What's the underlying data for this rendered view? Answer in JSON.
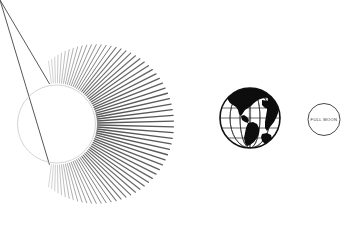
{
  "scene": {
    "title": "Sun, Earth and Full Moon diagram",
    "background_color": "#ffffff",
    "width": 354,
    "height": 241
  },
  "sun": {
    "name": "Sun",
    "center_x": 56.5,
    "center_y": 124,
    "radius": 39,
    "outline_color": "#c9c9c9",
    "outline_width": 0.8,
    "rays": {
      "count": 72,
      "color": "#585858",
      "start_angle_deg": -100,
      "end_angle_deg": 100,
      "inner_radius": 41,
      "min_length": 22,
      "max_length": 76,
      "max_width": 1.35,
      "min_width": 0.45
    }
  },
  "earth": {
    "name": "Earth",
    "center_x": 250,
    "center_y": 118,
    "radius": 30,
    "ocean_color": "#ffffff",
    "land_color": "#0d0d0d",
    "grid_color": "#2b2b2b",
    "outline_color": "#111111",
    "visible_hemisphere": "Americas"
  },
  "moon": {
    "name": "Moon",
    "label": "FULL MOON",
    "center_x": 324,
    "center_y": 119.5,
    "radius": 16,
    "outline_color": "#4a4a4a",
    "outline_width": 1.0,
    "fill_color": "#ffffff",
    "label_color": "#3a3a3a"
  }
}
